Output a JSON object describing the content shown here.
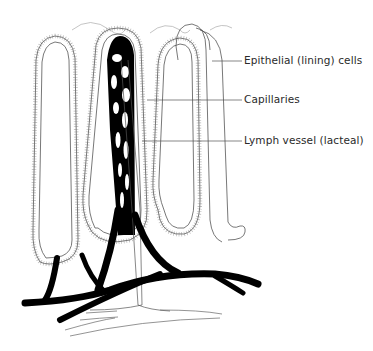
{
  "diagram": {
    "labels": [
      {
        "text": "Epithelial (lining) cells",
        "x": 244,
        "y": 57
      },
      {
        "text": "Capillaries",
        "x": 244,
        "y": 96
      },
      {
        "text": "Lymph vessel (lacteal)",
        "x": 244,
        "y": 136
      }
    ],
    "colors": {
      "background": "#ffffff",
      "outline": "#555555",
      "vessel": "#000000",
      "label_text": "#2a2a2a"
    }
  }
}
